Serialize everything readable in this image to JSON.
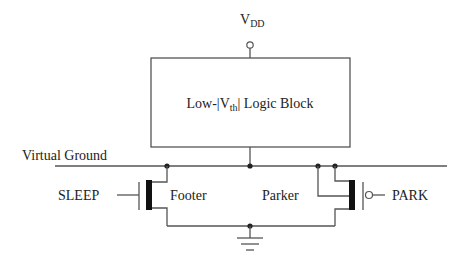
{
  "diagram": {
    "type": "circuit-schematic",
    "supply": {
      "label_main": "V",
      "label_sub": "DD"
    },
    "logic_block": {
      "prefix": "Low-|V",
      "sub": "th",
      "suffix": "| Logic Block"
    },
    "virtual_ground": {
      "label": "Virtual Ground"
    },
    "footer": {
      "label": "Footer",
      "control": "SLEEP",
      "transistor_type": "nmos"
    },
    "parker": {
      "label": "Parker",
      "control": "PARK",
      "transistor_type": "pmos"
    },
    "ground": {
      "symbol": "ground"
    }
  }
}
